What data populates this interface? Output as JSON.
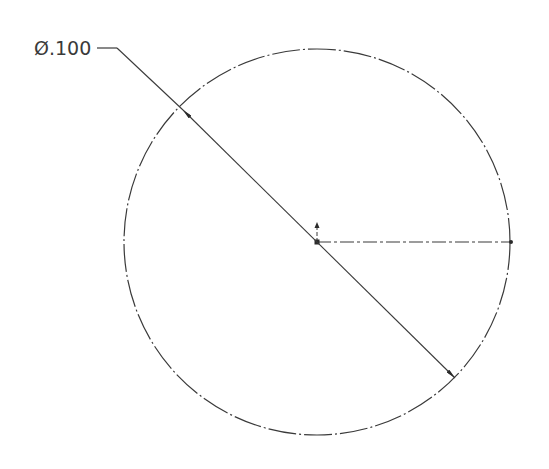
{
  "drawing": {
    "dimension_label": "Ø.100",
    "dimension_type": "diameter",
    "colors": {
      "background": "#ffffff",
      "geometry": "#3a3a3a",
      "text": "#3a3a3a"
    },
    "circle": {
      "cx": 317,
      "cy": 242,
      "r": 193,
      "line_style": "dash-dot"
    },
    "centerline": {
      "from": [
        317,
        242
      ],
      "to": [
        511,
        242
      ],
      "line_style": "dash-dot"
    },
    "leader": {
      "shoulder": [
        [
          97,
          48
        ],
        [
          117,
          48
        ]
      ],
      "diagonal": [
        [
          117,
          48
        ],
        [
          455,
          378
        ]
      ],
      "arrows": [
        [
          183,
          110
        ],
        [
          455,
          378
        ]
      ]
    },
    "origin_marker": {
      "x": 317,
      "y": 242,
      "arrow_up_to": 224
    }
  }
}
